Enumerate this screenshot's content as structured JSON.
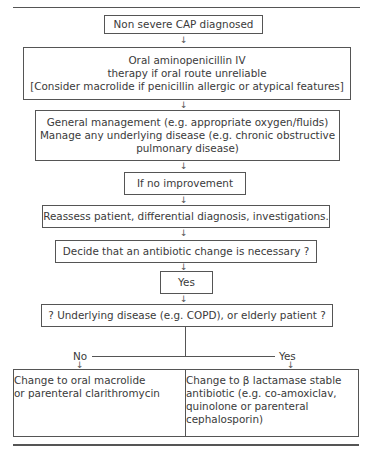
{
  "flowchart": {
    "nodes": [
      {
        "id": "start",
        "lines": [
          "Non severe CAP diagnosed"
        ]
      },
      {
        "id": "initial-therapy",
        "lines": [
          "Oral aminopenicillin IV",
          "therapy if oral route unreliable",
          "[Consider macrolide if penicillin allergic or atypical features]"
        ]
      },
      {
        "id": "general-management",
        "lines": [
          "General management (e.g. appropriate oxygen/fluids)",
          "Manage any underlying disease (e.g. chronic obstructive",
          "pulmonary disease)"
        ]
      },
      {
        "id": "no-improvement",
        "lines": [
          "If no improvement"
        ]
      },
      {
        "id": "reassess",
        "lines": [
          "Reassess patient, differential diagnosis, investigations."
        ]
      },
      {
        "id": "decide-change",
        "lines": [
          "Decide that an antibiotic change is necessary ?"
        ]
      },
      {
        "id": "yes",
        "lines": [
          "Yes"
        ]
      },
      {
        "id": "underlying-question",
        "lines": [
          "? Underlying disease (e.g. COPD), or elderly patient ?"
        ]
      },
      {
        "id": "macrolide",
        "lines": [
          "Change to oral macrolide",
          "or parenteral clarithromycin"
        ]
      },
      {
        "id": "beta-lactamase",
        "lines": [
          "Change to β lactamase stable",
          "antibiotic (e.g. co-amoxiclav,",
          "quinolone or parenteral",
          "cephalosporin)"
        ]
      }
    ],
    "branch_labels": {
      "no": "No",
      "yes": "Yes"
    },
    "arrow_glyph": "↓"
  }
}
